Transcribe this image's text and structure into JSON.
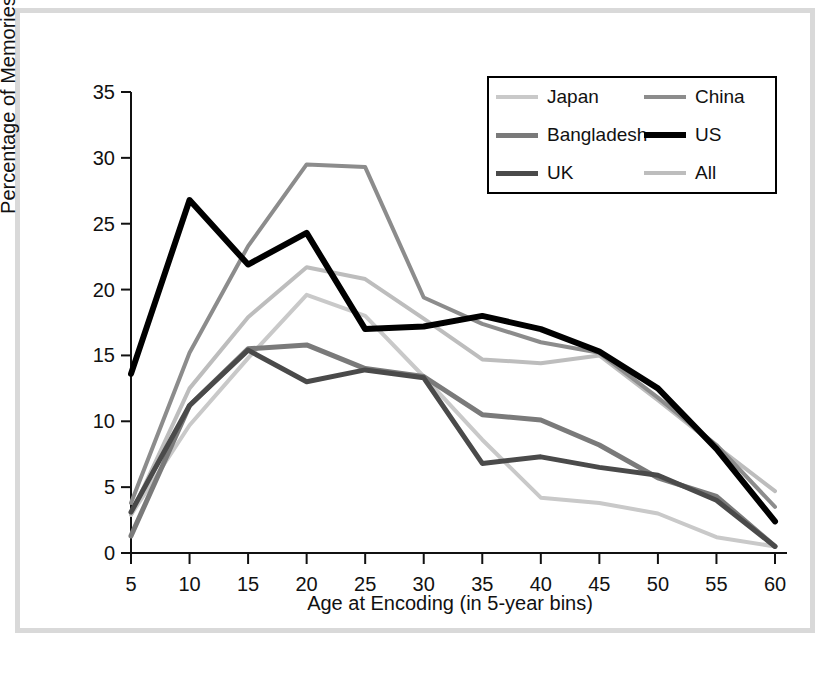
{
  "figure": {
    "border_color": "#d9d9d9",
    "background": "#ffffff"
  },
  "axes": {
    "xlabel": "Age at Encoding (in 5-year bins)",
    "ylabel": "Percentage of Memories",
    "x_ticks": [
      "5",
      "10",
      "15",
      "20",
      "25",
      "30",
      "35",
      "40",
      "45",
      "50",
      "55",
      "60"
    ],
    "y_ticks": [
      "0",
      "5",
      "10",
      "15",
      "20",
      "25",
      "30",
      "35"
    ]
  },
  "legend": {
    "entries": [
      {
        "label": "Japan",
        "color": "#c9c9c9",
        "width": 4
      },
      {
        "label": "China",
        "color": "#8c8c8c",
        "width": 4
      },
      {
        "label": "Bangladesh",
        "color": "#7a7a7a",
        "width": 5
      },
      {
        "label": "US",
        "color": "#000000",
        "width": 6
      },
      {
        "label": "UK",
        "color": "#4a4a4a",
        "width": 5
      },
      {
        "label": "All",
        "color": "#bdbdbd",
        "width": 4
      }
    ]
  },
  "chart_data": {
    "type": "line",
    "title": "",
    "xlabel": "Age at Encoding (in 5-year bins)",
    "ylabel": "Percentage of Memories",
    "x": [
      5,
      10,
      15,
      20,
      25,
      30,
      35,
      40,
      45,
      50,
      55,
      60
    ],
    "xlim": [
      5,
      60
    ],
    "ylim": [
      0,
      35
    ],
    "yticks": [
      0,
      5,
      10,
      15,
      20,
      25,
      30,
      35
    ],
    "grid": false,
    "legend_position": "upper right",
    "series": [
      {
        "name": "Japan",
        "color": "#c9c9c9",
        "width": 4,
        "values": [
          2.9,
          9.7,
          14.8,
          19.6,
          18.0,
          13.4,
          8.6,
          4.2,
          3.8,
          3.0,
          1.2,
          0.5
        ]
      },
      {
        "name": "China",
        "color": "#8c8c8c",
        "width": 4,
        "values": [
          3.8,
          15.2,
          23.3,
          29.5,
          29.3,
          19.4,
          17.4,
          16.0,
          15.2,
          11.8,
          8.2,
          3.5
        ]
      },
      {
        "name": "Bangladesh",
        "color": "#7a7a7a",
        "width": 5,
        "values": [
          1.3,
          11.2,
          15.5,
          15.8,
          14.0,
          13.4,
          10.5,
          10.1,
          8.2,
          5.7,
          4.3,
          0.5
        ]
      },
      {
        "name": "US",
        "color": "#000000",
        "width": 6,
        "values": [
          13.6,
          26.8,
          21.9,
          24.3,
          17.0,
          17.2,
          18.0,
          17.0,
          15.3,
          12.5,
          7.9,
          2.4
        ]
      },
      {
        "name": "UK",
        "color": "#4a4a4a",
        "width": 5,
        "values": [
          3.1,
          11.2,
          15.4,
          13.0,
          13.9,
          13.3,
          6.8,
          7.3,
          6.5,
          5.9,
          4.0,
          0.5
        ]
      },
      {
        "name": "All",
        "color": "#bdbdbd",
        "width": 4,
        "values": [
          2.9,
          12.5,
          17.9,
          21.7,
          20.8,
          17.8,
          14.7,
          14.4,
          15.0,
          11.6,
          8.1,
          4.7
        ]
      }
    ]
  }
}
